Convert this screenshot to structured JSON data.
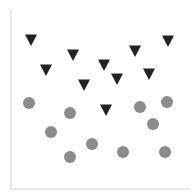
{
  "chart_data": {
    "type": "scatter",
    "title": "",
    "xlabel": "",
    "ylabel": "",
    "grid": false,
    "legend": null,
    "axes": {
      "left_axis": {
        "x": 11,
        "y1": 10,
        "y2": 190
      },
      "bottom_axis": {
        "y": 189,
        "x1": 11,
        "x2": 190
      },
      "color": "#d8d8d8"
    },
    "series": [
      {
        "name": "triangles",
        "marker": "triangle-down",
        "color": "#222222",
        "size": 12,
        "points": [
          {
            "x": 31,
            "y": 40
          },
          {
            "x": 46,
            "y": 70
          },
          {
            "x": 73,
            "y": 55
          },
          {
            "x": 84,
            "y": 85
          },
          {
            "x": 104,
            "y": 65
          },
          {
            "x": 117,
            "y": 79
          },
          {
            "x": 135,
            "y": 51
          },
          {
            "x": 149,
            "y": 74
          },
          {
            "x": 168,
            "y": 41
          },
          {
            "x": 106,
            "y": 110
          }
        ]
      },
      {
        "name": "circles",
        "marker": "circle",
        "color": "#8c8c8c",
        "size": 12,
        "points": [
          {
            "x": 29,
            "y": 103
          },
          {
            "x": 70,
            "y": 113
          },
          {
            "x": 51,
            "y": 132
          },
          {
            "x": 70,
            "y": 157
          },
          {
            "x": 92,
            "y": 144
          },
          {
            "x": 123,
            "y": 152
          },
          {
            "x": 140,
            "y": 107
          },
          {
            "x": 167,
            "y": 102
          },
          {
            "x": 153,
            "y": 124
          },
          {
            "x": 165,
            "y": 152
          }
        ]
      }
    ]
  }
}
